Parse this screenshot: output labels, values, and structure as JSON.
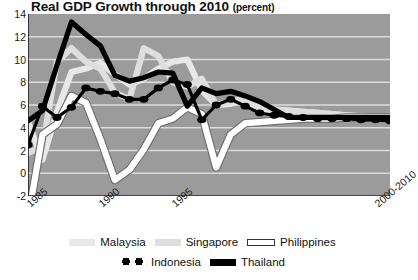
{
  "chart_data": {
    "type": "line",
    "title": "Real GDP Growth through 2010",
    "title_unit": "(percent)",
    "xlabel": "",
    "ylabel": "percent",
    "ylim": [
      -2,
      14
    ],
    "yticks": [
      14,
      12,
      10,
      8,
      6,
      4,
      2,
      0,
      -2
    ],
    "grid": true,
    "legend_position": "bottom",
    "x": [
      1985,
      1986,
      1987,
      1988,
      1989,
      1990,
      1991,
      1992,
      1993,
      1994,
      1995,
      1996,
      1997,
      1998,
      1999,
      2000,
      2001,
      2002,
      2003,
      2004,
      2005,
      2006,
      2007,
      2008,
      2009,
      2010
    ],
    "xticks": [
      1985,
      1990,
      1995,
      "2000-2010"
    ],
    "xtick_labels": [
      "1985",
      "1990",
      "1995",
      "2000-2010"
    ],
    "series": [
      {
        "name": "Malaysia",
        "color": "#e8e8e8",
        "style": "solid-thick",
        "values": [
          4.5,
          1.2,
          5.4,
          8.9,
          9.2,
          9.7,
          8.7,
          7.8,
          8.3,
          9.2,
          9.8,
          10.0,
          7.3,
          6.0,
          6.1,
          6.5,
          5.4,
          5.6,
          5.5,
          5.4,
          5.3,
          5.2,
          5.1,
          5.0,
          4.9,
          4.8
        ]
      },
      {
        "name": "Singapore",
        "color": "#dedede",
        "style": "solid-thick",
        "values": [
          1.8,
          2.3,
          9.8,
          11.0,
          9.8,
          9.2,
          7.1,
          6.5,
          11.0,
          10.3,
          8.0,
          7.6,
          8.3,
          6.0,
          6.3,
          6.6,
          5.8,
          5.6,
          5.5,
          5.4,
          5.3,
          5.2,
          5.1,
          5.0,
          4.9,
          4.8
        ]
      },
      {
        "name": "Philippines",
        "color": "#ffffff",
        "style": "solid-thick-outline",
        "values": [
          -4.0,
          3.4,
          4.3,
          6.8,
          6.2,
          3.0,
          -0.6,
          0.3,
          2.1,
          4.4,
          4.8,
          5.8,
          5.2,
          0.5,
          3.4,
          4.4,
          4.5,
          4.6,
          4.7,
          4.8,
          4.8,
          4.8,
          4.9,
          4.9,
          4.9,
          4.9
        ]
      },
      {
        "name": "Indonesia",
        "color": "#000000",
        "style": "dotted-beaded",
        "values": [
          2.5,
          5.9,
          4.9,
          5.8,
          7.5,
          7.2,
          7.0,
          6.5,
          6.5,
          7.5,
          8.2,
          7.8,
          4.7,
          6.0,
          6.5,
          5.9,
          5.3,
          5.1,
          5.0,
          4.9,
          4.8,
          4.8,
          4.8,
          4.7,
          4.7,
          4.6
        ]
      },
      {
        "name": "Thailand",
        "color": "#000000",
        "style": "solid-thick",
        "values": [
          4.6,
          5.5,
          9.5,
          13.3,
          12.2,
          11.2,
          8.6,
          8.1,
          8.4,
          8.9,
          8.8,
          5.9,
          7.5,
          7.0,
          7.2,
          6.8,
          6.3,
          5.6,
          4.9,
          4.9,
          4.9,
          4.9,
          4.9,
          4.9,
          4.9,
          4.9
        ]
      }
    ]
  },
  "legend": {
    "row1": [
      {
        "label": "Malaysia",
        "swatch": "malaysia-swatch"
      },
      {
        "label": "Singapore",
        "swatch": "singapore-swatch"
      },
      {
        "label": "Philippines",
        "swatch": "philippines-swatch"
      }
    ],
    "row2": [
      {
        "label": "Indonesia",
        "swatch": "indonesia-swatch"
      },
      {
        "label": "Thailand",
        "swatch": "thailand-swatch"
      }
    ]
  },
  "colors": {
    "plot_background": "#9b9b9b",
    "gridline": "#dcdcdc",
    "axis": "#1a1a1a",
    "page_background": "#ffffff"
  }
}
